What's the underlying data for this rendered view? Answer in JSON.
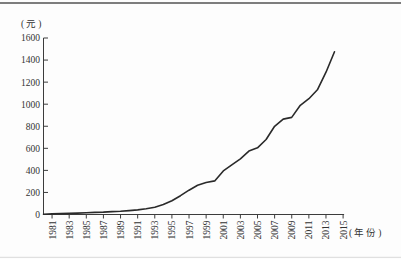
{
  "page": {
    "background": "#fdfdfd"
  },
  "decor": {
    "top_rule_color": "#7d7d7d",
    "bottom_rule_color": "#d9d9d9"
  },
  "chart_data": {
    "type": "line",
    "title": "",
    "ylabel": "(元)",
    "xlabel": "(年份)",
    "x": [
      1980,
      1981,
      1982,
      1983,
      1984,
      1985,
      1986,
      1987,
      1988,
      1989,
      1990,
      1991,
      1992,
      1993,
      1994,
      1995,
      1996,
      1997,
      1998,
      1999,
      2000,
      2001,
      2002,
      2003,
      2004,
      2005,
      2006,
      2007,
      2008,
      2009,
      2010,
      2011,
      2012,
      2013,
      2014
    ],
    "values": [
      3,
      5,
      8,
      10,
      13,
      16,
      19,
      22,
      26,
      30,
      35,
      42,
      52,
      65,
      90,
      125,
      170,
      220,
      265,
      290,
      305,
      395,
      450,
      505,
      575,
      605,
      680,
      800,
      865,
      880,
      990,
      1050,
      1130,
      1290,
      1475
    ],
    "x_tick_labels": [
      "1981",
      "1983",
      "1985",
      "1987",
      "1989",
      "1991",
      "1993",
      "1995",
      "1997",
      "1999",
      "2001",
      "2003",
      "2005",
      "2007",
      "2009",
      "2011",
      "2013",
      "2015"
    ],
    "y_ticks": [
      0,
      200,
      400,
      600,
      800,
      1000,
      1200,
      1400,
      1600
    ],
    "xlim": [
      1980,
      2015
    ],
    "ylim": [
      0,
      1600
    ],
    "grid": false,
    "legend": "none",
    "line_color": "#2a2a2a",
    "axis_color": "#3c3c3c",
    "text_color": "#333333"
  }
}
